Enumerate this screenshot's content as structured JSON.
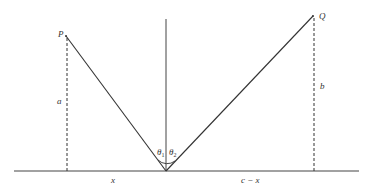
{
  "diagram": {
    "points": {
      "P": {
        "label": "P"
      },
      "Q": {
        "label": "Q"
      }
    },
    "labels": {
      "height_p": "a",
      "height_q": "b",
      "dist_left": "x",
      "dist_right": "c − x",
      "angle_incident": "θ",
      "angle_incident_sub": "1",
      "angle_reflected": "θ",
      "angle_reflected_sub": "2"
    },
    "colors": {
      "line": "#333333",
      "background": "#ffffff"
    }
  }
}
